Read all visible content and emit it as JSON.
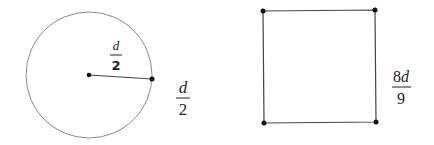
{
  "diagram": {
    "circle": {
      "center": [
        89,
        75
      ],
      "radius": 63,
      "radius_endpoint": [
        152,
        79
      ],
      "inner_label": {
        "numerator": "d",
        "denominator": "2"
      },
      "outer_label": {
        "numerator": "d",
        "denominator": "2"
      }
    },
    "square": {
      "corners": [
        [
          263,
          11
        ],
        [
          375,
          10
        ],
        [
          376,
          122
        ],
        [
          264,
          123
        ]
      ],
      "side_label": {
        "numerator": "8d",
        "denominator": "9"
      }
    },
    "colors": {
      "stroke": "#444444",
      "circle_stroke": "#888888",
      "dot": "#111111",
      "text": "#222222"
    }
  }
}
